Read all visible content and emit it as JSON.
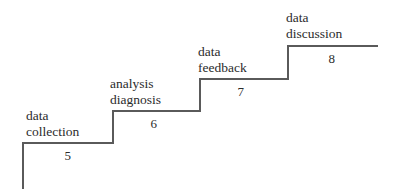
{
  "figure": {
    "kind": "staircase-process-diagram",
    "background_color": "#ffffff",
    "line_color": "#5a5a5a",
    "text_color": "#2b2b2b",
    "line_width": 1.2,
    "width": 398,
    "height": 189
  },
  "steps": [
    {
      "id": "step-5",
      "number": "5",
      "label_line1": "data",
      "label_line2": "collection",
      "tread_y": 143,
      "tread_x_start": 23,
      "tread_x_end": 113,
      "label_x": 26,
      "label_y": 108,
      "number_x": 68,
      "number_y": 148
    },
    {
      "id": "step-6",
      "number": "6",
      "label_line1": "analysis",
      "label_line2": "diagnosis",
      "tread_y": 111,
      "tread_x_start": 113,
      "tread_x_end": 200,
      "label_x": 110,
      "label_y": 76,
      "number_x": 154,
      "number_y": 116
    },
    {
      "id": "step-7",
      "number": "7",
      "label_line1": "data",
      "label_line2": "feedback",
      "tread_y": 79,
      "tread_x_start": 200,
      "tread_x_end": 288,
      "label_x": 198,
      "label_y": 44,
      "number_x": 241,
      "number_y": 84
    },
    {
      "id": "step-8",
      "number": "8",
      "label_line1": "data",
      "label_line2": "discussion",
      "tread_y": 46,
      "tread_x_start": 288,
      "tread_x_end": 378,
      "label_x": 286,
      "label_y": 10,
      "number_x": 332,
      "number_y": 51
    }
  ],
  "left_stem": {
    "x": 23,
    "y_top": 143,
    "y_bottom": 189
  },
  "chart_data": {
    "type": "bar",
    "title": "",
    "xlabel": "",
    "ylabel": "",
    "categories": [
      "data collection",
      "analysis diagnosis",
      "data feedback",
      "data discussion"
    ],
    "values": [
      5,
      6,
      7,
      8
    ],
    "grid": false,
    "legend": null
  }
}
